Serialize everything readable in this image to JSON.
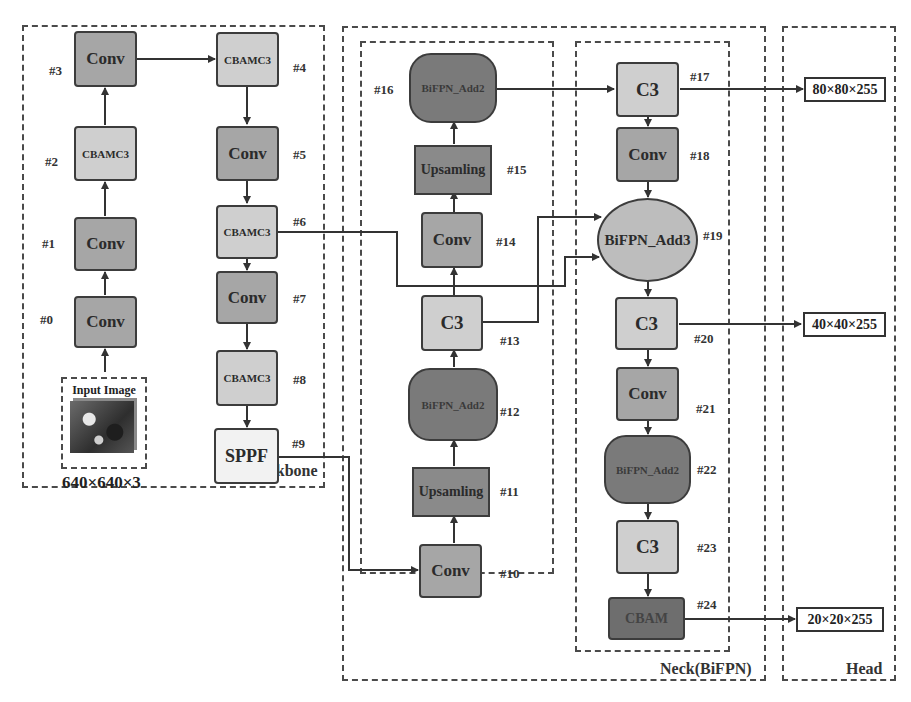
{
  "groups": {
    "backbone": "Backbone",
    "neck": "Neck(BiFPN)",
    "head": "Head"
  },
  "input": {
    "title": "Input Image",
    "dims": "640×640×3"
  },
  "nodes": [
    {
      "id": "#0",
      "label": "Conv"
    },
    {
      "id": "#1",
      "label": "Conv"
    },
    {
      "id": "#2",
      "label": "CBAMC3"
    },
    {
      "id": "#3",
      "label": "Conv"
    },
    {
      "id": "#4",
      "label": "CBAMC3"
    },
    {
      "id": "#5",
      "label": "Conv"
    },
    {
      "id": "#6",
      "label": "CBAMC3"
    },
    {
      "id": "#7",
      "label": "Conv"
    },
    {
      "id": "#8",
      "label": "CBAMC3"
    },
    {
      "id": "#9",
      "label": "SPPF"
    },
    {
      "id": "#10",
      "label": "Conv"
    },
    {
      "id": "#11",
      "label": "Upsamling"
    },
    {
      "id": "#12",
      "label": "BiFPN_Add2"
    },
    {
      "id": "#13",
      "label": "C3"
    },
    {
      "id": "#14",
      "label": "Conv"
    },
    {
      "id": "#15",
      "label": "Upsamling"
    },
    {
      "id": "#16",
      "label": "BiFPN_Add2"
    },
    {
      "id": "#17",
      "label": "C3"
    },
    {
      "id": "#18",
      "label": "Conv"
    },
    {
      "id": "#19",
      "label": "BiFPN_Add3"
    },
    {
      "id": "#20",
      "label": "C3"
    },
    {
      "id": "#21",
      "label": "Conv"
    },
    {
      "id": "#22",
      "label": "BiFPN_Add2"
    },
    {
      "id": "#23",
      "label": "C3"
    },
    {
      "id": "#24",
      "label": "CBAM"
    }
  ],
  "outputs": [
    "80×80×255",
    "40×40×255",
    "20×20×255"
  ],
  "colors": {
    "conv": "#a6a6a6",
    "cbamc3": "#cfcfcf",
    "c3": "#cfcfcf",
    "sppf": "#f2f2f2",
    "upsampling": "#8a8a8a",
    "bifpn_add2": "#7a7a7a",
    "bifpn_add3": "#bdbdbd",
    "cbam": "#6e6e6e"
  }
}
